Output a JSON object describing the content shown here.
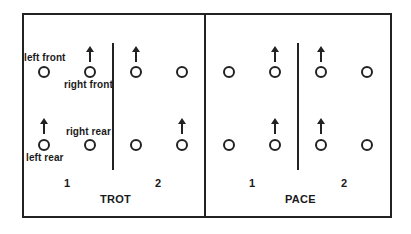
{
  "diagram": {
    "colors": {
      "line": "#222222",
      "background": "#ffffff"
    },
    "panels": [
      {
        "title": "TROT",
        "phase_labels": [
          "1",
          "2"
        ],
        "leg_labels": {
          "left_front": "left front",
          "right_front": "right front",
          "right_rear": "right rear",
          "left_rear": "left rear"
        },
        "phase_1": {
          "raised_legs": [
            "right front",
            "left rear"
          ]
        },
        "phase_2": {
          "raised_legs": [
            "left front",
            "right rear"
          ]
        }
      },
      {
        "title": "PACE",
        "phase_labels": [
          "1",
          "2"
        ],
        "phase_1": {
          "raised_legs": [
            "right front",
            "right rear"
          ]
        },
        "phase_2": {
          "raised_legs": [
            "left front",
            "left rear"
          ]
        }
      }
    ]
  }
}
